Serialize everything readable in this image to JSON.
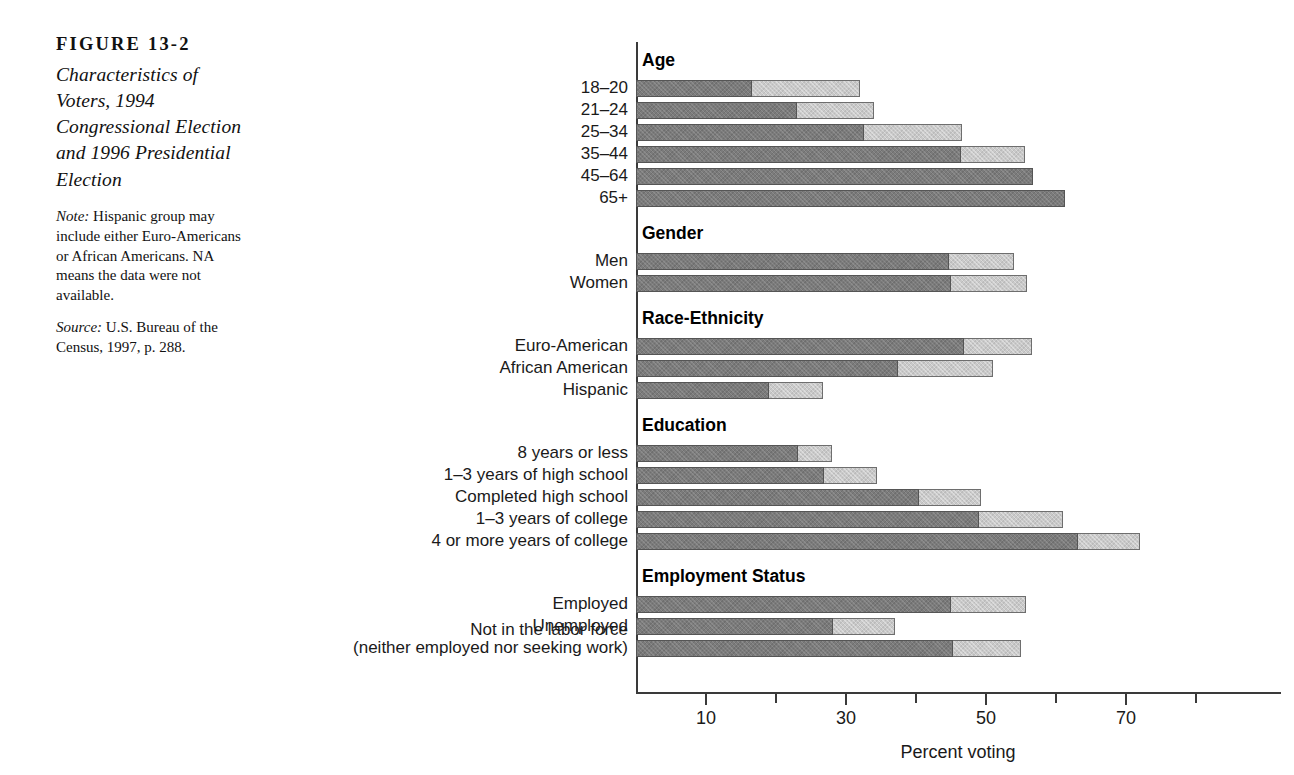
{
  "caption": {
    "figure_number": "FIGURE 13-2",
    "title": "Characteristics of Voters, 1994 Congressional Election and 1996 Presidential Election",
    "note_lead": "Note:",
    "note_text": " Hispanic group may include either Euro-Americans or African Americans. NA means the data were not available.",
    "source_lead": "Source:",
    "source_text": " U.S. Bureau of the Census, 1997, p. 288."
  },
  "chart_data": {
    "type": "bar",
    "orientation": "horizontal",
    "stacked": false,
    "title": "Characteristics of Voters, 1994 Congressional Election and 1996 Presidential Election",
    "xlabel": "Percent voting",
    "ylabel": "",
    "xlim": [
      0,
      80
    ],
    "xticks": [
      10,
      30,
      50,
      70
    ],
    "xtick_labels": [
      "10",
      "30",
      "50",
      "70"
    ],
    "minor_xticks": [
      20,
      40,
      60,
      80
    ],
    "grid": false,
    "legend": "none",
    "series": [
      {
        "name": "1994 Congressional Election",
        "color": "#7b7b7b"
      },
      {
        "name": "1996 Presidential Election",
        "color": "#c9c9c9"
      }
    ],
    "groups": [
      {
        "heading": "Age",
        "rows": [
          {
            "label": "18–20",
            "congressional": 16.6,
            "presidential": 32.0
          },
          {
            "label": "21–24",
            "congressional": 23.0,
            "presidential": 34.0
          },
          {
            "label": "25–34",
            "congressional": 32.6,
            "presidential": 46.6
          },
          {
            "label": "35–44",
            "congressional": 46.4,
            "presidential": 55.6
          },
          {
            "label": "45–64",
            "congressional": 56.7,
            "presidential": null
          },
          {
            "label": "65+",
            "congressional": 61.3,
            "presidential": null
          }
        ]
      },
      {
        "heading": "Gender",
        "rows": [
          {
            "label": "Men",
            "congressional": 44.7,
            "presidential": 54.0
          },
          {
            "label": "Women",
            "congressional": 45.0,
            "presidential": 55.9
          }
        ]
      },
      {
        "heading": "Race-Ethnicity",
        "rows": [
          {
            "label": "Euro-American",
            "congressional": 46.9,
            "presidential": 56.6
          },
          {
            "label": "African American",
            "congressional": 37.4,
            "presidential": 51.0
          },
          {
            "label": "Hispanic",
            "congressional": 19.0,
            "presidential": 26.7
          }
        ]
      },
      {
        "heading": "Education",
        "rows": [
          {
            "label": "8 years or less",
            "congressional": 23.1,
            "presidential": 28.0
          },
          {
            "label": "1–3 years of high school",
            "congressional": 26.9,
            "presidential": 34.4
          },
          {
            "label": "Completed high school",
            "congressional": 40.4,
            "presidential": 49.3
          },
          {
            "label": "1–3 years of college",
            "congressional": 49.0,
            "presidential": 61.0
          },
          {
            "label": "4 or more years of college",
            "congressional": 63.1,
            "presidential": 72.0
          }
        ]
      },
      {
        "heading": "Employment Status",
        "rows": [
          {
            "label": "Employed",
            "congressional": 45.0,
            "presidential": 55.7
          },
          {
            "label": "Unemployed",
            "congressional": 28.1,
            "presidential": 37.0
          },
          {
            "label": "Not in the labor force\n(neither employed nor seeking work)",
            "congressional": 45.3,
            "presidential": 55.0
          }
        ]
      }
    ]
  }
}
